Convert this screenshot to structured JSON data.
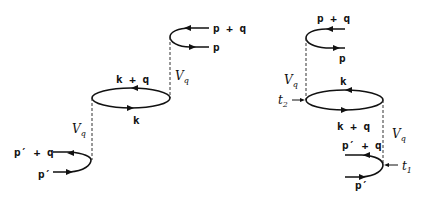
{
  "diagrams": [
    {
      "name": "left",
      "labels": {
        "top_in": "p + q",
        "top_out": "p",
        "bubble_top": "k + q",
        "bubble_bottom": "k",
        "interaction_upper": "V",
        "interaction_upper_sub": "q",
        "interaction_lower": "V",
        "interaction_lower_sub": "q",
        "bottom_in": "p′ + q",
        "bottom_out": "p′"
      }
    },
    {
      "name": "right",
      "labels": {
        "top_in": "p + q",
        "top_out": "p",
        "bubble_top": "k",
        "bubble_bottom": "k + q",
        "interaction_upper": "V",
        "interaction_upper_sub": "q",
        "interaction_lower": "V",
        "interaction_lower_sub": "q",
        "bottom_in": "p′ + q",
        "bottom_out": "p′",
        "time_upper": "t",
        "time_upper_sub": "2",
        "time_lower": "t",
        "time_lower_sub": "1"
      }
    }
  ]
}
